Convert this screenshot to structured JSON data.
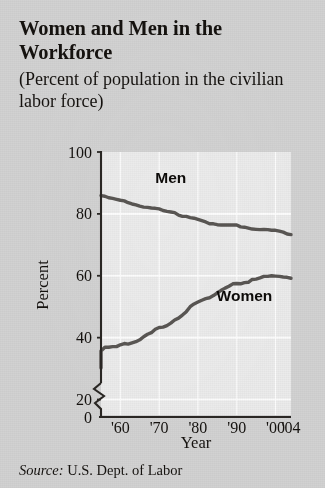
{
  "figure": {
    "title": "Women and Men in the Workforce",
    "subtitle": "(Percent of population in the civilian labor force)",
    "source_keyword": "Source:",
    "source_text": "U.S. Dept. of Labor"
  },
  "colors": {
    "page_background": "#d2d2d2",
    "plot_background": "#ebebeb",
    "gridline": "#ffffff",
    "axis": "#2a2724",
    "series_line": "#595653",
    "text": "#15120f"
  },
  "chart_data": {
    "type": "line",
    "title": "Women and Men in the Workforce",
    "subtitle": "(Percent of population in the civilian labor force)",
    "xlabel": "Year",
    "ylabel": "Percent",
    "xlim": [
      1955,
      2004
    ],
    "ylim": [
      0,
      100
    ],
    "y_axis_break": true,
    "y_break_between": [
      0,
      20
    ],
    "grid": true,
    "legend": "inline-labels",
    "y_ticks": [
      0,
      20,
      40,
      60,
      80,
      100
    ],
    "y_tick_labels": [
      "0",
      "20",
      "40",
      "60",
      "80",
      "100"
    ],
    "x_ticks": [
      1960,
      1970,
      1980,
      1990,
      2000,
      2004
    ],
    "x_tick_labels": [
      "'60",
      "'70",
      "'80",
      "'90",
      "'00",
      "'04"
    ],
    "x": [
      1955,
      1956,
      1957,
      1958,
      1959,
      1960,
      1961,
      1962,
      1963,
      1964,
      1965,
      1966,
      1967,
      1968,
      1969,
      1970,
      1971,
      1972,
      1973,
      1974,
      1975,
      1976,
      1977,
      1978,
      1979,
      1980,
      1981,
      1982,
      1983,
      1984,
      1985,
      1986,
      1987,
      1988,
      1989,
      1990,
      1991,
      1992,
      1993,
      1994,
      1995,
      1996,
      1997,
      1998,
      1999,
      2000,
      2001,
      2002,
      2003,
      2004
    ],
    "series": [
      {
        "name": "Men",
        "label": "Men",
        "label_at": {
          "x": 1973,
          "y": 90
        },
        "values": [
          85.9,
          85.7,
          85.2,
          85.0,
          84.7,
          84.4,
          84.2,
          83.6,
          83.2,
          82.9,
          82.5,
          82.2,
          82.1,
          81.9,
          81.8,
          81.6,
          81.1,
          80.8,
          80.6,
          80.4,
          79.6,
          79.2,
          79.2,
          78.8,
          78.6,
          78.2,
          77.8,
          77.4,
          76.8,
          76.8,
          76.5,
          76.4,
          76.4,
          76.4,
          76.4,
          76.4,
          75.8,
          75.7,
          75.4,
          75.1,
          75.0,
          74.9,
          75.0,
          74.9,
          74.7,
          74.7,
          74.4,
          74.1,
          73.5,
          73.3
        ]
      },
      {
        "name": "Women",
        "label": "Women",
        "label_at": {
          "x": 1992,
          "y": 52
        },
        "values": [
          35.7,
          36.9,
          36.9,
          37.1,
          37.1,
          37.7,
          38.1,
          37.9,
          38.3,
          38.7,
          39.3,
          40.3,
          41.1,
          41.6,
          42.7,
          43.3,
          43.4,
          43.9,
          44.7,
          45.7,
          46.3,
          47.3,
          48.4,
          50.0,
          50.9,
          51.5,
          52.1,
          52.6,
          52.9,
          53.6,
          54.5,
          55.3,
          56.0,
          56.6,
          57.4,
          57.5,
          57.4,
          57.8,
          57.9,
          58.8,
          58.9,
          59.3,
          59.8,
          59.8,
          60.0,
          59.9,
          59.8,
          59.6,
          59.5,
          59.2
        ]
      }
    ]
  },
  "geometry": {
    "plot_left": 101,
    "plot_right": 291,
    "plot_top": 152,
    "plot_bottom": 415,
    "value_at_plot_top": 100,
    "value_at_plot_bottom": 15,
    "axis_zero_y": 417
  }
}
